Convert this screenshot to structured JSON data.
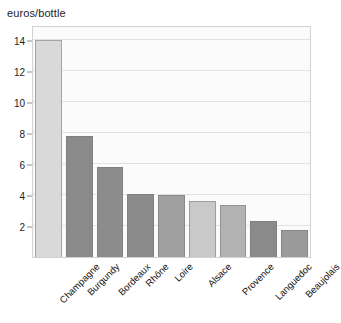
{
  "chart_data": {
    "type": "bar",
    "title": "euros/bottle",
    "xlabel": "",
    "ylabel": "euros/bottle",
    "ylim": [
      0,
      15
    ],
    "yticks": [
      2,
      4,
      6,
      8,
      10,
      12,
      14
    ],
    "grid": true,
    "legend": "none",
    "categories": [
      "Champagne",
      "Burgundy",
      "Bordeaux",
      "Rhône",
      "Loire",
      "Alsace",
      "Provence",
      "Languedoc",
      "Beaujolais"
    ],
    "values": [
      14.05,
      7.85,
      5.8,
      4.05,
      4.0,
      3.6,
      3.35,
      2.3,
      1.75
    ],
    "bar_colors": [
      "#d9d9d9",
      "#8a8a8a",
      "#8c8c8c",
      "#8a8a8a",
      "#a0a0a0",
      "#c9c9c9",
      "#b3b3b3",
      "#8a8a8a",
      "#9a9a9a"
    ]
  },
  "colors": {
    "plot_background": "#fbfbfb",
    "grid": "#e2e2e2",
    "frame": "#d2d2d2",
    "text": "#1d1d1d"
  }
}
